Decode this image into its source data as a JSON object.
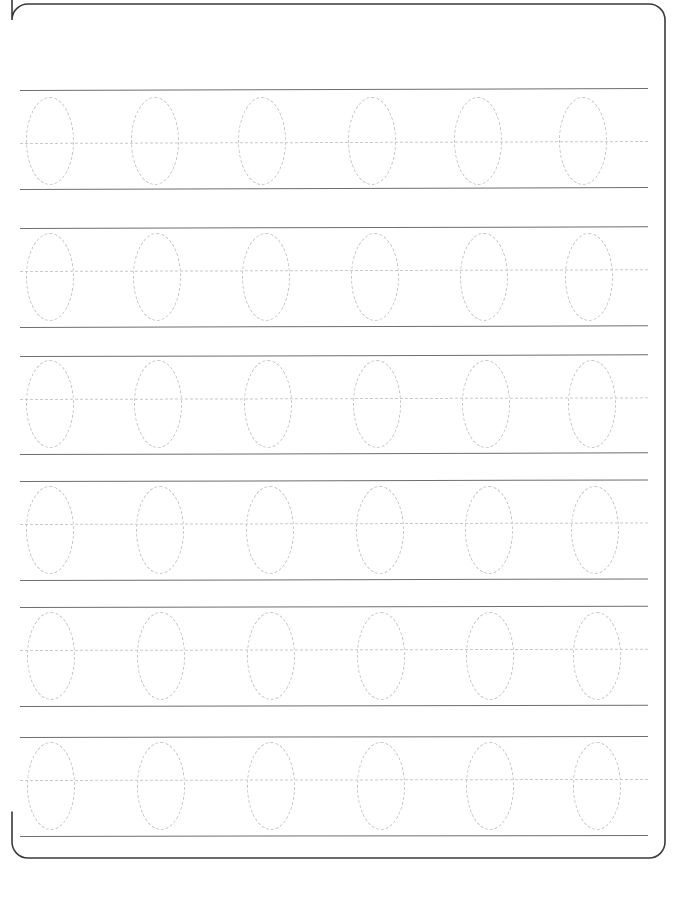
{
  "document": {
    "type": "handwriting-tracing-worksheet",
    "title": "Letter O Tracing Practice Worksheet",
    "page_width": 698,
    "page_height": 897,
    "background_color": "#ffffff",
    "rows_total": 6,
    "ovals_per_row": 6,
    "ovals_total": 36,
    "traced_character": "O"
  },
  "frame": {
    "name": "page-border",
    "color": "#3a3a3f",
    "stroke_width": 1.6,
    "left": 12,
    "top": 4,
    "right": 665,
    "bottom": 858,
    "corner_radius": 16,
    "visible_edges": [
      "right",
      "bottom",
      "top-left-arc",
      "top-right-arc",
      "bottom-left-arc",
      "bottom-right-arc"
    ]
  },
  "styles": {
    "solid_line_color": "#6e6e73",
    "solid_line_width": 1.4,
    "dashed_line_color": "#c9c9ce",
    "dashed_line_width": 1.3,
    "oval_stroke_color": "#c2c2c8",
    "oval_stroke_width": 1.6,
    "oval_dash": "dashed"
  },
  "line_extent": {
    "start_x": 20,
    "end_x": 648
  },
  "oval_size": {
    "width": 48,
    "height": 88
  },
  "rows": [
    {
      "id": "row-1",
      "index": 1,
      "label": "Practice Row 1",
      "top_line_y": 90,
      "mid_line_y": 143,
      "bottom_line_y": 189,
      "line_start_x": 20,
      "line_end_x": 648,
      "tilt_deg": -0.18,
      "ovals": [
        {
          "index": 1,
          "center_x": 50,
          "center_y": 141
        },
        {
          "index": 2,
          "center_x": 155,
          "center_y": 141
        },
        {
          "index": 3,
          "center_x": 262,
          "center_y": 141
        },
        {
          "index": 4,
          "center_x": 372,
          "center_y": 141
        },
        {
          "index": 5,
          "center_x": 478,
          "center_y": 141
        },
        {
          "index": 6,
          "center_x": 583,
          "center_y": 141
        }
      ]
    },
    {
      "id": "row-2",
      "index": 2,
      "label": "Practice Row 2",
      "top_line_y": 228,
      "mid_line_y": 271,
      "bottom_line_y": 327,
      "line_start_x": 20,
      "line_end_x": 648,
      "tilt_deg": -0.16,
      "ovals": [
        {
          "index": 1,
          "center_x": 50,
          "center_y": 277
        },
        {
          "index": 2,
          "center_x": 157,
          "center_y": 277
        },
        {
          "index": 3,
          "center_x": 266,
          "center_y": 277
        },
        {
          "index": 4,
          "center_x": 375,
          "center_y": 277
        },
        {
          "index": 5,
          "center_x": 484,
          "center_y": 277
        },
        {
          "index": 6,
          "center_x": 589,
          "center_y": 277
        }
      ]
    },
    {
      "id": "row-3",
      "index": 3,
      "label": "Practice Row 3",
      "top_line_y": 356,
      "mid_line_y": 399,
      "bottom_line_y": 454,
      "line_start_x": 20,
      "line_end_x": 648,
      "tilt_deg": -0.15,
      "ovals": [
        {
          "index": 1,
          "center_x": 50,
          "center_y": 404
        },
        {
          "index": 2,
          "center_x": 158,
          "center_y": 404
        },
        {
          "index": 3,
          "center_x": 268,
          "center_y": 404
        },
        {
          "index": 4,
          "center_x": 377,
          "center_y": 404
        },
        {
          "index": 5,
          "center_x": 486,
          "center_y": 404
        },
        {
          "index": 6,
          "center_x": 592,
          "center_y": 404
        }
      ]
    },
    {
      "id": "row-4",
      "index": 4,
      "label": "Practice Row 4",
      "top_line_y": 481,
      "mid_line_y": 524,
      "bottom_line_y": 580,
      "line_start_x": 20,
      "line_end_x": 648,
      "tilt_deg": -0.14,
      "ovals": [
        {
          "index": 1,
          "center_x": 50,
          "center_y": 530
        },
        {
          "index": 2,
          "center_x": 160,
          "center_y": 530
        },
        {
          "index": 3,
          "center_x": 270,
          "center_y": 530
        },
        {
          "index": 4,
          "center_x": 380,
          "center_y": 530
        },
        {
          "index": 5,
          "center_x": 489,
          "center_y": 530
        },
        {
          "index": 6,
          "center_x": 595,
          "center_y": 530
        }
      ]
    },
    {
      "id": "row-5",
      "index": 5,
      "label": "Practice Row 5",
      "top_line_y": 607,
      "mid_line_y": 650,
      "bottom_line_y": 706,
      "line_start_x": 20,
      "line_end_x": 648,
      "tilt_deg": -0.12,
      "ovals": [
        {
          "index": 1,
          "center_x": 51,
          "center_y": 656
        },
        {
          "index": 2,
          "center_x": 161,
          "center_y": 656
        },
        {
          "index": 3,
          "center_x": 271,
          "center_y": 656
        },
        {
          "index": 4,
          "center_x": 381,
          "center_y": 656
        },
        {
          "index": 5,
          "center_x": 490,
          "center_y": 656
        },
        {
          "index": 6,
          "center_x": 597,
          "center_y": 656
        }
      ]
    },
    {
      "id": "row-6",
      "index": 6,
      "label": "Practice Row 6",
      "top_line_y": 737,
      "mid_line_y": 780,
      "bottom_line_y": 836,
      "line_start_x": 20,
      "line_end_x": 648,
      "tilt_deg": -0.1,
      "ovals": [
        {
          "index": 1,
          "center_x": 51,
          "center_y": 786
        },
        {
          "index": 2,
          "center_x": 161,
          "center_y": 786
        },
        {
          "index": 3,
          "center_x": 271,
          "center_y": 786
        },
        {
          "index": 4,
          "center_x": 381,
          "center_y": 786
        },
        {
          "index": 5,
          "center_x": 490,
          "center_y": 786
        },
        {
          "index": 6,
          "center_x": 597,
          "center_y": 786
        }
      ]
    }
  ]
}
